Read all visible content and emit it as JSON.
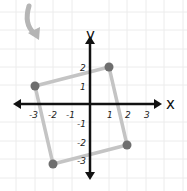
{
  "diagram": {
    "type": "coordinate-plane",
    "axes": {
      "x_label": "x",
      "y_label": "y",
      "x_ticks": [
        "-3",
        "-2",
        "-1",
        "1",
        "2",
        "3"
      ],
      "y_ticks": [
        "2",
        "1",
        "-1",
        "-2",
        "-3"
      ]
    },
    "shape": {
      "kind": "square",
      "vertices": [
        [
          -3,
          1
        ],
        [
          1,
          2
        ],
        [
          2,
          -2
        ],
        [
          -2,
          -3
        ]
      ],
      "edge_color": "#c4c4c4",
      "vertex_color": "#6e6e6e"
    },
    "annotation": {
      "kind": "curved-arrow",
      "meaning": "rotation",
      "color": "#b5b5b5"
    },
    "colors": {
      "grid": "#ececec",
      "axis": "#111111",
      "background": "#ffffff"
    }
  }
}
